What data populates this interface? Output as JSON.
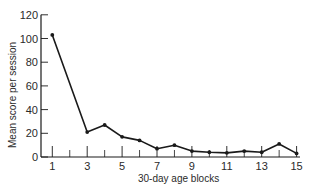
{
  "chart_data": {
    "type": "line",
    "title": "",
    "xlabel": "30-day age blocks",
    "ylabel": "Mean score per session",
    "x": [
      1,
      3,
      4,
      5,
      6,
      7,
      8,
      9,
      10,
      11,
      12,
      13,
      14,
      15
    ],
    "series": [
      {
        "name": "Mean score per session",
        "values": [
          103,
          21,
          27,
          17,
          14,
          7,
          10,
          5,
          4,
          3.5,
          5,
          4,
          11,
          3
        ]
      }
    ],
    "xlim": [
      0.35,
      15.2
    ],
    "ylim": [
      0,
      120
    ],
    "x_ticks_major_labeled": [
      "1",
      "3",
      "5",
      "7",
      "9",
      "11",
      "13",
      "15"
    ],
    "x_ticks_minor": [
      2,
      4,
      6,
      8,
      10,
      12,
      14
    ],
    "y_ticks": [
      "0",
      "20",
      "40",
      "60",
      "80",
      "100",
      "120"
    ],
    "grid": false,
    "legend": "none",
    "line_color": "#1a1a1a",
    "marker": "filled-circle"
  }
}
